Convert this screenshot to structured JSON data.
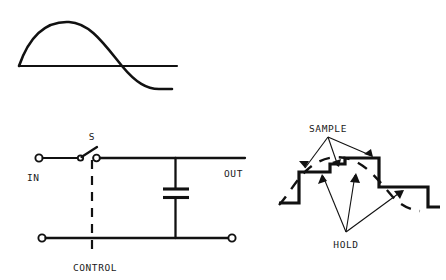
{
  "figure": {
    "title": "",
    "stroke_color": "#111111",
    "background_color": "#ffffff",
    "width": 446,
    "height": 280
  },
  "waveform_panel": {
    "name": "sine-wave",
    "description": "analog sine wave crossing a horizontal baseline"
  },
  "circuit": {
    "labels": {
      "input": "IN",
      "output": "OUT",
      "switch": "S",
      "control": "CONTROL"
    },
    "components": {
      "switch_name": "S",
      "capacitor_name": "capacitor",
      "in_terminal_name": "IN",
      "out_terminal_name": "OUT"
    }
  },
  "sampled_signal": {
    "labels": {
      "sample": "SAMPLE",
      "hold": "HOLD"
    }
  }
}
